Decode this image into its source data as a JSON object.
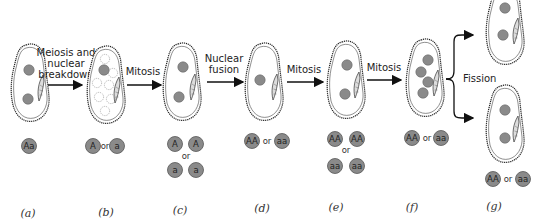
{
  "diagram": {
    "type": "process-flow",
    "colors": {
      "nucleus_fill": "#8a8a8a",
      "nucleus_stroke": "#555555",
      "cell_outline": "#222222",
      "arrow": "#111111",
      "background": "#ffffff"
    },
    "steps": [
      {
        "from": "a",
        "to": "b",
        "label_lines": [
          "Meiosis and",
          "nuclear",
          "breakdown"
        ]
      },
      {
        "from": "b",
        "to": "c",
        "label_lines": [
          "Mitosis"
        ]
      },
      {
        "from": "c",
        "to": "d",
        "label_lines": [
          "Nuclear",
          "fusion"
        ]
      },
      {
        "from": "d",
        "to": "e",
        "label_lines": [
          "Mitosis"
        ]
      },
      {
        "from": "e",
        "to": "f",
        "label_lines": [
          "Mitosis"
        ]
      },
      {
        "from": "f",
        "to": "g",
        "label_lines": [
          "Fission"
        ]
      }
    ],
    "stages": [
      {
        "id": "a",
        "label": "(a)",
        "genotype_rows": [
          [
            "Aa"
          ]
        ],
        "nuclei": 2,
        "degenerating_nuclei": 0
      },
      {
        "id": "b",
        "label": "(b)",
        "genotype_rows": [
          [
            "A",
            "or",
            "a"
          ]
        ],
        "nuclei": 1,
        "degenerating_nuclei": 7
      },
      {
        "id": "c",
        "label": "(c)",
        "genotype_rows": [
          [
            "A",
            "A"
          ],
          [
            "or"
          ],
          [
            "a",
            "a"
          ]
        ],
        "nuclei": 2,
        "degenerating_nuclei": 0
      },
      {
        "id": "d",
        "label": "(d)",
        "genotype_rows": [
          [
            "AA",
            "or",
            "aa"
          ]
        ],
        "nuclei": 1,
        "degenerating_nuclei": 0
      },
      {
        "id": "e",
        "label": "(e)",
        "genotype_rows": [
          [
            "AA",
            "AA"
          ],
          [
            "or"
          ],
          [
            "aa",
            "aa"
          ]
        ],
        "nuclei": 2,
        "degenerating_nuclei": 0
      },
      {
        "id": "f",
        "label": "(f)",
        "genotype_rows": [
          [
            "AA",
            "or",
            "aa"
          ]
        ],
        "nuclei": 4,
        "degenerating_nuclei": 0
      },
      {
        "id": "g",
        "label": "(g)",
        "genotype_rows": [
          [
            "AA",
            "or",
            "aa"
          ]
        ],
        "nuclei": 2,
        "degenerating_nuclei": 0,
        "cells": 2
      }
    ],
    "text": {
      "step1_l1": "Meiosis and",
      "step1_l2": "nuclear",
      "step1_l3": "breakdown",
      "step2": "Mitosis",
      "step3_l1": "Nuclear",
      "step3_l2": "fusion",
      "step4": "Mitosis",
      "step5": "Mitosis",
      "step6": "Fission",
      "or": "or",
      "a_geno": "Aa",
      "b_geno1": "A",
      "b_geno2": "a",
      "c_geno1": "A",
      "c_geno2": "A",
      "c_geno3": "a",
      "c_geno4": "a",
      "d_geno1": "AA",
      "d_geno2": "aa",
      "e_geno1": "AA",
      "e_geno2": "AA",
      "e_geno3": "aa",
      "e_geno4": "aa",
      "f_geno1": "AA",
      "f_geno2": "aa",
      "g_geno1": "AA",
      "g_geno2": "aa",
      "stage_a": "(a)",
      "stage_b": "(b)",
      "stage_c": "(c)",
      "stage_d": "(d)",
      "stage_e": "(e)",
      "stage_f": "(f)",
      "stage_g": "(g)"
    }
  }
}
